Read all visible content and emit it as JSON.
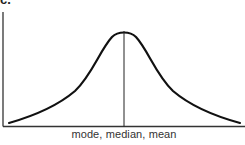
{
  "figure": {
    "panel_label": "c.",
    "x_axis_label": "mode, median, mean",
    "curve": "symmetric bell-shaped (normal) distribution",
    "center_marker": "vertical line at peak",
    "colors": {
      "curve": "#111111",
      "axis": "#333333",
      "marker": "#222222",
      "background": "#ffffff"
    }
  }
}
